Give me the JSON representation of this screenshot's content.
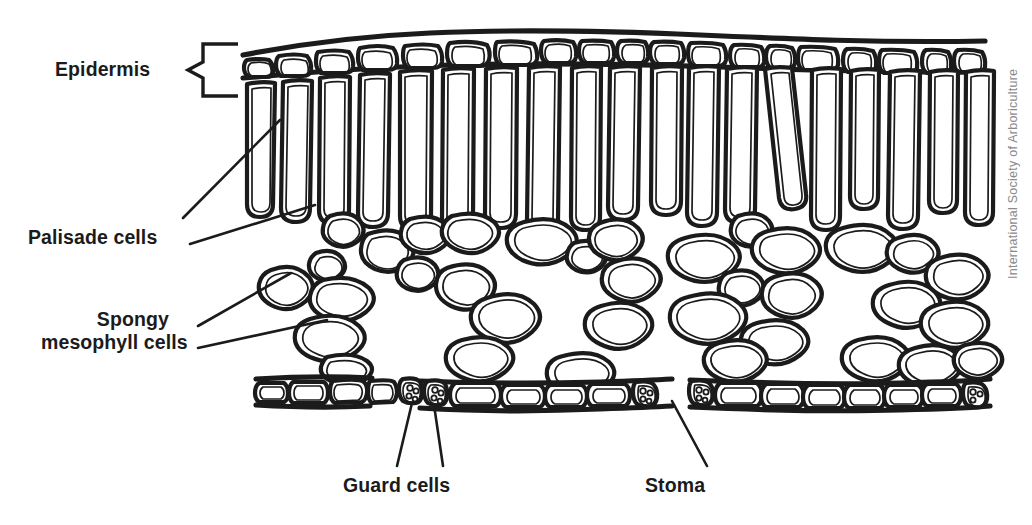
{
  "figure": {
    "type": "biological-diagram",
    "background_color": "#ffffff",
    "ink_color": "#1b1b1b",
    "credit": "International Society of Arboriculture",
    "credit_color": "#8a8a8a"
  },
  "labels": {
    "epidermis": "Epidermis",
    "palisade": "Palisade cells",
    "spongy_line1": "Spongy",
    "spongy_line2": "mesophyll cells",
    "guard": "Guard cells",
    "stoma": "Stoma"
  },
  "icons": {
    "epidermis_bracket": "left-bracket-icon",
    "palisade_leader": "leader-line-icon",
    "spongy_leader": "leader-line-icon",
    "guard_leader": "leader-line-icon",
    "stoma_leader": "leader-line-icon"
  },
  "structures": [
    {
      "name": "upper-cuticle",
      "label": "Cuticle (upper surface)",
      "description": "Thick continuous line across the top of the upper epidermis"
    },
    {
      "name": "upper-epidermis",
      "label": "Epidermis",
      "description": "Single row of flattened rounded rectangular cells along the top",
      "cell_count": 24
    },
    {
      "name": "palisade-layer",
      "label": "Palisade cells",
      "description": "Row of tall narrow columnar cells beneath the upper epidermis",
      "cell_count": 23
    },
    {
      "name": "spongy-mesophyll",
      "label": "Spongy mesophyll cells",
      "description": "Irregular rounded cells loosely packed with large intercellular air spaces",
      "cell_count": 62
    },
    {
      "name": "lower-epidermis",
      "label": "Epidermis (lower surface)",
      "description": "Row of rectangular cells along the bottom, interrupted by stomata",
      "cell_count": 21
    },
    {
      "name": "guard-cells",
      "label": "Guard cells",
      "description": "Paired cells flanking each stoma, containing small round chloroplasts",
      "cell_count": 6
    },
    {
      "name": "stomata",
      "label": "Stoma",
      "description": "Pore openings in the lower epidermis between pairs of guard cells",
      "count": 3
    }
  ]
}
